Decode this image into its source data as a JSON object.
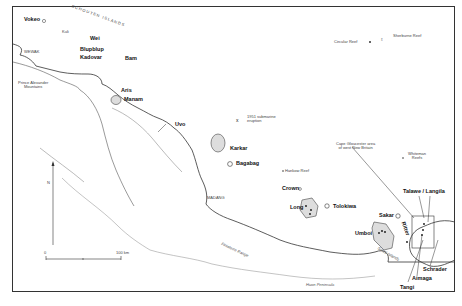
{
  "map": {
    "title_region": "Schouten Islands to West New Britain",
    "volcanoes": [
      {
        "name": "Vokeo",
        "x": 40,
        "y": 20
      },
      {
        "name": "Kuli",
        "x": 62,
        "y": 34
      },
      {
        "name": "Wei",
        "x": 90,
        "y": 38
      },
      {
        "name": "Blupblup",
        "x": 82,
        "y": 49
      },
      {
        "name": "Kadovar",
        "x": 80,
        "y": 56
      },
      {
        "name": "Bam",
        "x": 125,
        "y": 57
      },
      {
        "name": "Manam",
        "x": 124,
        "y": 99
      },
      {
        "name": "Aris",
        "x": 120,
        "y": 91
      },
      {
        "name": "Uvo",
        "x": 176,
        "y": 121
      },
      {
        "name": "Karkar",
        "x": 232,
        "y": 149
      },
      {
        "name": "Bagabag",
        "x": 236,
        "y": 163
      },
      {
        "name": "Crown",
        "x": 278,
        "y": 188
      },
      {
        "name": "Long",
        "x": 290,
        "y": 206
      },
      {
        "name": "Tolokiwa",
        "x": 333,
        "y": 207
      },
      {
        "name": "Sakar",
        "x": 378,
        "y": 214
      },
      {
        "name": "Umboi",
        "x": 355,
        "y": 232
      },
      {
        "name": "Ritter",
        "x": 398,
        "y": 228
      },
      {
        "name": "Talawe / Langila",
        "x": 403,
        "y": 191
      },
      {
        "name": "Schrader",
        "x": 423,
        "y": 268
      },
      {
        "name": "Aimaga",
        "x": 413,
        "y": 278
      },
      {
        "name": "Tangi",
        "x": 400,
        "y": 286
      }
    ],
    "other_labels": {
      "schouten_islands": "SCHOUTEN ISLANDS",
      "wewak": "WEWAK",
      "prince_alexander": "Prince Alexander\nMountains",
      "madang": "MADANG",
      "submarine_eruption": "1951 submarine\neruption",
      "hankow_reef": "Hankow Reef",
      "circular_reef": "Circular Reef",
      "sherburne_reef": "Sherburne Reef",
      "whiteman_reefs": "Whiteman\nReefs",
      "cape_gloucester": "Cape Gloucester area\nof west New Britain",
      "finisterre_range": "Finisterre Range",
      "huon_peninsula": "Huon Peninsula",
      "siassi_islands": "Siassi Islands",
      "north": "N",
      "scale_start": "0",
      "scale_end": "100 km"
    }
  }
}
